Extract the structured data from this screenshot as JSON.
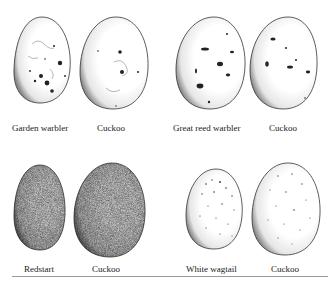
{
  "plate": {
    "pairs": [
      {
        "host": {
          "label": "Garden warbler",
          "pattern": "blotched"
        },
        "cuckoo": {
          "label": "Cuckoo",
          "pattern": "blotched"
        }
      },
      {
        "host": {
          "label": "Great reed warbler",
          "pattern": "blotched"
        },
        "cuckoo": {
          "label": "Cuckoo",
          "pattern": "blotched"
        }
      },
      {
        "host": {
          "label": "Redstart",
          "pattern": "uniform-stipple"
        },
        "cuckoo": {
          "label": "Cuckoo",
          "pattern": "uniform-stipple"
        }
      },
      {
        "host": {
          "label": "White wagtail",
          "pattern": "fine-speckled"
        },
        "cuckoo": {
          "label": "Cuckoo",
          "pattern": "fine-speckled"
        }
      }
    ]
  }
}
